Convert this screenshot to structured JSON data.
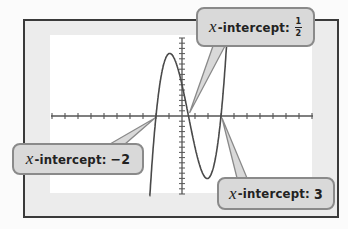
{
  "chart_data": {
    "type": "line",
    "title": "",
    "function": "f(x) = 2(x + 2)(x - 1/2)(x - 3)",
    "window": {
      "xmin": -10,
      "xmax": 10,
      "xscl": 1,
      "ymin": -15,
      "ymax": 15,
      "yscl": 1
    },
    "x_intercepts": [
      -2,
      0.5,
      3
    ],
    "grid": false,
    "series": [
      {
        "name": "f(x)",
        "color": "#4a4a4a"
      }
    ],
    "annotations": [
      {
        "id": "half",
        "var": "x",
        "text": "-intercept:",
        "value": "1/2",
        "numerator": "1",
        "denominator": "2",
        "points_to": [
          0.5,
          0
        ]
      },
      {
        "id": "neg2",
        "var": "x",
        "text": "-intercept:",
        "value": "−2",
        "points_to": [
          -2,
          0
        ]
      },
      {
        "id": "three",
        "var": "x",
        "text": "-intercept:",
        "value": "3",
        "points_to": [
          3,
          0
        ]
      }
    ]
  },
  "callouts": {
    "half": {
      "var": "x",
      "label": "-intercept:",
      "num": "1",
      "den": "2"
    },
    "neg2": {
      "var": "x",
      "label": "-intercept:",
      "value": "−2"
    },
    "three": {
      "var": "x",
      "label": "-intercept:",
      "value": "3"
    }
  },
  "colors": {
    "frame_border": "#3a3a3a",
    "frame_fill": "#ececec",
    "screen": "#ffffff",
    "axis": "#555555",
    "curve": "#4a4a4a",
    "callout_fill": "#d9d9d9",
    "callout_border": "#8a8a8a"
  }
}
